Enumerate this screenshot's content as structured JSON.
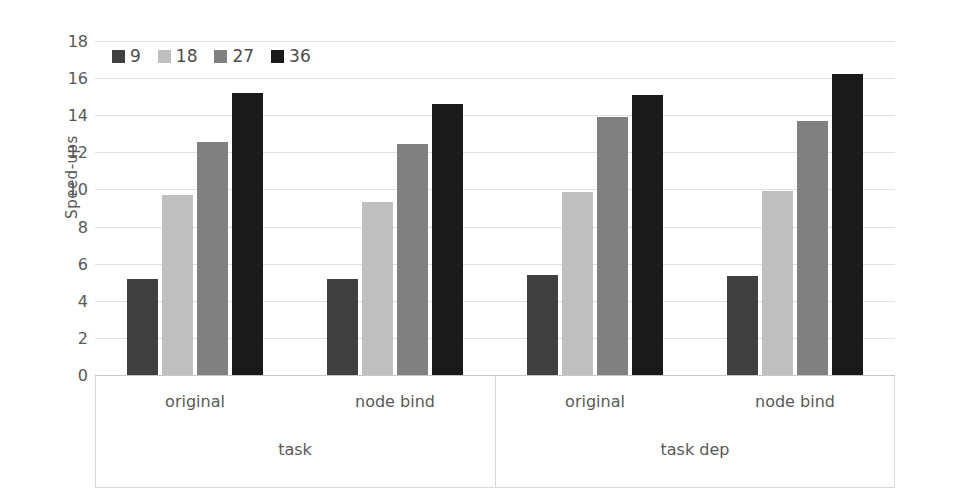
{
  "chart_data": {
    "type": "bar",
    "title": "",
    "subtitle": "",
    "xlabel": "",
    "ylabel": "Speed-ups",
    "ylim": [
      0,
      18
    ],
    "ytick_step": 2,
    "yticks": [
      18,
      16,
      14,
      12,
      10,
      8,
      6,
      4,
      2,
      0
    ],
    "grid": true,
    "legend_position": "top-left inside plot",
    "grouping": "grouped, two-tier category axis",
    "tier1_categories": [
      "original",
      "node bind",
      "original",
      "node bind"
    ],
    "tier2_categories": [
      "task",
      "task dep"
    ],
    "categories": [
      "task / original",
      "task / node bind",
      "task dep / original",
      "task dep / node bind"
    ],
    "series": [
      {
        "name": "9",
        "color": "#404040",
        "values": [
          5.2,
          5.2,
          5.4,
          5.35
        ]
      },
      {
        "name": "18",
        "color": "#bfbfbf",
        "values": [
          9.7,
          9.3,
          9.85,
          9.9
        ]
      },
      {
        "name": "27",
        "color": "#808080",
        "values": [
          12.55,
          12.45,
          13.9,
          13.7
        ]
      },
      {
        "name": "36",
        "color": "#1a1a1a",
        "values": [
          15.2,
          14.6,
          15.1,
          16.2
        ]
      }
    ]
  },
  "legend": {
    "items": [
      {
        "label": "9",
        "color": "#404040"
      },
      {
        "label": "18",
        "color": "#bfbfbf"
      },
      {
        "label": "27",
        "color": "#808080"
      },
      {
        "label": "36",
        "color": "#1a1a1a"
      }
    ]
  },
  "axes": {
    "y_title": "Speed-ups",
    "y_tick_labels": [
      "18",
      "16",
      "14",
      "12",
      "10",
      "8",
      "6",
      "4",
      "2",
      "0"
    ],
    "tier1_labels": [
      "original",
      "node bind",
      "original",
      "node bind"
    ],
    "tier2_labels": [
      "task",
      "task dep"
    ]
  },
  "style": {
    "background": "#ffffff",
    "gridline_color": "#e0e0e0",
    "axis_line_color": "#d9d9d9",
    "text_color": "#595959"
  }
}
